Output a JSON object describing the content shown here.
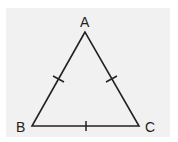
{
  "diagram": {
    "type": "isosceles-equilateral-triangle",
    "background_color": "#f1f1f1",
    "stroke_color": "#222222",
    "vertices": [
      {
        "label": "A",
        "x": 85,
        "y": 32
      },
      {
        "label": "B",
        "x": 32,
        "y": 126
      },
      {
        "label": "C",
        "x": 139,
        "y": 126
      }
    ],
    "labels": {
      "a": "A",
      "b": "B",
      "c": "C"
    },
    "tick_marks": {
      "AB": 1,
      "AC": 1,
      "BC": 1
    }
  }
}
